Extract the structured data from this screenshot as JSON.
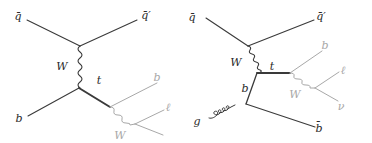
{
  "colors": {
    "dark_line": "#3a3a3a",
    "gray_line": "#a8a8a8",
    "background": "#ffffff"
  },
  "diagrams": [
    {
      "name": "t-channel single top",
      "labels": {
        "qbar_in": "q̄",
        "qbar_out": "q̄′",
        "w_exchange": "W",
        "b_in": "b",
        "top": "t",
        "b_decay": "b",
        "w_decay": "W",
        "lepton": "ℓ"
      }
    },
    {
      "name": "t-channel single top with gluon splitting",
      "labels": {
        "qbar_in": "q̄",
        "qbar_out": "q̄′",
        "w_exchange": "W",
        "top": "t",
        "b_internal": "b",
        "gluon": "g",
        "bbar_out": "b̄",
        "b_decay": "b",
        "w_decay": "W",
        "lepton": "ℓ",
        "neutrino": "ν"
      }
    }
  ]
}
